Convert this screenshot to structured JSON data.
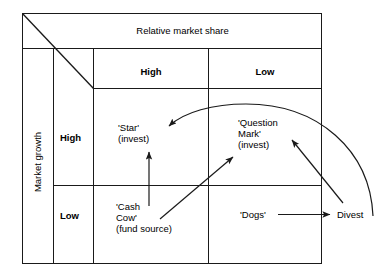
{
  "diagram": {
    "type": "bcg-growth-share-matrix",
    "x_axis_title": "Relative market share",
    "y_axis_title": "Market growth",
    "column_headers": [
      "High",
      "Low"
    ],
    "row_headers": [
      "High",
      "Low"
    ],
    "cells": {
      "star": {
        "name": "'Star'",
        "note": "(invest)"
      },
      "question_mark": {
        "name_line1": "'Question",
        "name_line2": "Mark'",
        "note": "(invest)"
      },
      "cash_cow": {
        "name_line1": "'Cash",
        "name_line2": "Cow'",
        "note": "(fund source)"
      },
      "dogs": {
        "name": "'Dogs'"
      }
    },
    "outcome_label": "Divest",
    "flows": [
      {
        "from": "Cash Cow",
        "to": "Star",
        "style": "straight-vertical"
      },
      {
        "from": "Cash Cow",
        "to": "Question Mark",
        "style": "straight-diagonal"
      },
      {
        "from": "Question Mark",
        "to": "Star",
        "style": "curved-arc"
      },
      {
        "from": "Dogs",
        "to": "Divest",
        "style": "straight-horizontal"
      },
      {
        "from": "Divest",
        "to": "Question Mark",
        "style": "straight-diagonal"
      }
    ],
    "colors": {
      "line": "#1a1a1a",
      "background": "#ffffff",
      "text": "#000000"
    }
  }
}
